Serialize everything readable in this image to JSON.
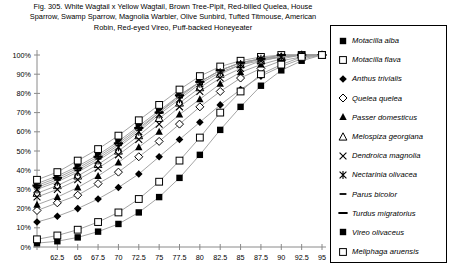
{
  "figure": {
    "title_lines": [
      "Fig. 305.  White Wagtail x Yellow Wagtail, Brown Tree-Pipit, Red-billed Quelea, House",
      "Sparrow, Swamp Sparrow, Magnolia Warbler, Olive Sunbird, Tufted Titmouse, American",
      "Robin, Red-eyed Vireo, Puff-backed Honeyeater"
    ]
  },
  "chart_data": {
    "type": "line",
    "xlabel": "",
    "ylabel": "",
    "xlim": [
      60,
      95
    ],
    "ylim": [
      0,
      100
    ],
    "grid": false,
    "legend_position": "right",
    "x": [
      60,
      62.5,
      65,
      67.5,
      70,
      72.5,
      75,
      77.5,
      80,
      82.5,
      85,
      87.5,
      90,
      92.5,
      95
    ],
    "xtick_labels": [
      "",
      "62.5",
      "65",
      "67.5",
      "70",
      "72.5",
      "75",
      "77.5",
      "80",
      "82.5",
      "85",
      "87.5",
      "90",
      "92.5",
      "95"
    ],
    "ytick_labels": [
      "0%",
      "10%",
      "20%",
      "30%",
      "40%",
      "50%",
      "60%",
      "70%",
      "80%",
      "90%",
      "100%"
    ],
    "series": [
      {
        "name": "Motacilla alba",
        "marker": "filled-square",
        "values": [
          33,
          37,
          42,
          48,
          55,
          63,
          71,
          79,
          86,
          92,
          96,
          98,
          99,
          100,
          100
        ]
      },
      {
        "name": "Motacilla flava",
        "marker": "open-square",
        "values": [
          35,
          39,
          45,
          51,
          58,
          66,
          74,
          82,
          89,
          94,
          97,
          99,
          100,
          100,
          100
        ]
      },
      {
        "name": "Anthus trivialis",
        "marker": "filled-diamond",
        "values": [
          13,
          16,
          20,
          25,
          31,
          38,
          47,
          56,
          65,
          74,
          82,
          89,
          94,
          98,
          100
        ]
      },
      {
        "name": "Quelea quelea",
        "marker": "open-diamond",
        "values": [
          19,
          23,
          27,
          33,
          39,
          47,
          55,
          64,
          73,
          81,
          88,
          93,
          97,
          99,
          100
        ]
      },
      {
        "name": "Passer domesticus",
        "marker": "filled-triangle",
        "values": [
          22,
          26,
          31,
          37,
          44,
          52,
          60,
          69,
          77,
          85,
          91,
          95,
          98,
          100,
          100
        ]
      },
      {
        "name": "Melospiza georgiana",
        "marker": "open-triangle",
        "values": [
          28,
          32,
          37,
          43,
          50,
          58,
          67,
          75,
          83,
          90,
          95,
          97,
          99,
          100,
          100
        ]
      },
      {
        "name": "Dendroica magnolia",
        "marker": "x-cross",
        "values": [
          26,
          30,
          35,
          41,
          48,
          56,
          64,
          73,
          81,
          88,
          93,
          97,
          99,
          100,
          100
        ]
      },
      {
        "name": "Nectarinia olivacea",
        "marker": "asterisk",
        "values": [
          30,
          34,
          39,
          45,
          52,
          60,
          69,
          77,
          85,
          91,
          95,
          98,
          99,
          100,
          100
        ]
      },
      {
        "name": "Parus bicolor",
        "marker": "dash-short",
        "values": [
          31,
          35,
          40,
          46,
          53,
          61,
          70,
          78,
          86,
          92,
          96,
          98,
          100,
          100,
          100
        ]
      },
      {
        "name": "Turdus migratorius",
        "marker": "dash-long",
        "values": [
          32,
          36,
          41,
          47,
          54,
          62,
          70,
          79,
          86,
          92,
          96,
          98,
          100,
          100,
          100
        ]
      },
      {
        "name": "Vireo olivaceus",
        "marker": "filled-square",
        "values": [
          2,
          3,
          5,
          8,
          12,
          18,
          26,
          36,
          48,
          61,
          73,
          84,
          92,
          97,
          100
        ]
      },
      {
        "name": "Meliphaga aruensis",
        "marker": "open-square",
        "values": [
          4,
          6,
          9,
          13,
          18,
          25,
          34,
          45,
          57,
          70,
          81,
          90,
          95,
          99,
          100
        ]
      }
    ]
  }
}
